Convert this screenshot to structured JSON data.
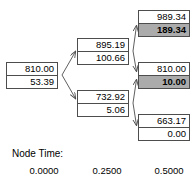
{
  "diagram": {
    "type": "binomial-lattice-tree",
    "title": "",
    "nodes": [
      {
        "id": "root",
        "label": "root-node",
        "column": 0,
        "top_value": "810.00",
        "bottom_value": "53.39",
        "highlighted": false
      },
      {
        "id": "up",
        "label": "up-node",
        "column": 1,
        "top_value": "895.19",
        "bottom_value": "100.66",
        "highlighted": false
      },
      {
        "id": "down",
        "label": "down-node",
        "column": 1,
        "top_value": "732.92",
        "bottom_value": "5.06",
        "highlighted": false
      },
      {
        "id": "up-up",
        "label": "up-up-node",
        "column": 2,
        "top_value": "989.34",
        "bottom_value": "189.34",
        "highlighted": true
      },
      {
        "id": "up-down",
        "label": "up-down-node",
        "column": 2,
        "top_value": "810.00",
        "bottom_value": "10.00",
        "highlighted": true
      },
      {
        "id": "down-down",
        "label": "down-down-node",
        "column": 2,
        "top_value": "663.17",
        "bottom_value": "0.00",
        "highlighted": false
      }
    ],
    "edges": [
      {
        "from": "root",
        "to": "up"
      },
      {
        "from": "root",
        "to": "down"
      },
      {
        "from": "up",
        "to": "up-up"
      },
      {
        "from": "up",
        "to": "up-down"
      },
      {
        "from": "down",
        "to": "up-down"
      },
      {
        "from": "down",
        "to": "down-down"
      }
    ],
    "colors": {
      "highlight_fill": "#ababab",
      "node_border": "#4d4d4d",
      "node_fill": "#ffffff",
      "edge": "#4d4d4d",
      "text": "#000000"
    }
  },
  "footer": {
    "title": "Node Time:",
    "ticks": [
      "0.0000",
      "0.2500",
      "0.5000"
    ]
  }
}
